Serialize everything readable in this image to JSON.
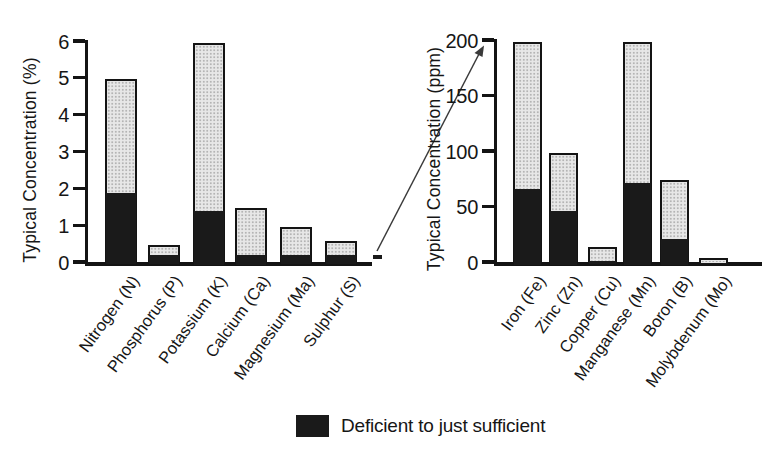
{
  "figure": {
    "legend": {
      "label": "Deficient to just sufficient"
    },
    "colors": {
      "deficient_fill": "#1a1a1a",
      "typical_fill": "#e7e7e7",
      "typical_dot": "#b4b4b4",
      "axis": "#141414",
      "background": "#ffffff",
      "arrow": "#3a3a3a"
    },
    "annotation": "magnification arrow linking the % chart baseline to the top of the ppm scale"
  },
  "chart_data": [
    {
      "type": "bar",
      "stacked": true,
      "title": "",
      "xlabel": "",
      "ylabel": "Typical Concentration (%)",
      "ylim": [
        0,
        6
      ],
      "yticks": [
        0,
        1,
        2,
        3,
        4,
        5,
        6
      ],
      "grid": false,
      "legend_position": "bottom",
      "categories": [
        "Nitrogen (N)",
        "Phosphorus (P)",
        "Potassium (K)",
        "Calcium (Ca)",
        "Magnesium (Ma)",
        "Sulphur (S)"
      ],
      "series": [
        {
          "name": "Deficient to just sufficient",
          "values": [
            2.0,
            0.3,
            1.5,
            0.3,
            0.3,
            0.3
          ]
        },
        {
          "name": "Sufficient to typical (upper stack)",
          "values": [
            3.0,
            0.2,
            4.5,
            1.2,
            0.7,
            0.3
          ]
        }
      ],
      "totals": [
        5.0,
        0.5,
        6.0,
        1.5,
        1.0,
        0.6
      ]
    },
    {
      "type": "bar",
      "stacked": true,
      "title": "",
      "xlabel": "",
      "ylabel": "Typical Concentration (ppm)",
      "ylim": [
        0,
        200
      ],
      "yticks": [
        0,
        50,
        100,
        150,
        200
      ],
      "grid": false,
      "legend_position": "bottom",
      "categories": [
        "Iron (Fe)",
        "Zinc (Zn)",
        "Copper (Cu)",
        "Manganese (Mn)",
        "Boron (B)",
        "Molybdenum (Mo)"
      ],
      "series": [
        {
          "name": "Deficient to just sufficient",
          "values": [
            70,
            50,
            5,
            75,
            25,
            2
          ]
        },
        {
          "name": "Sufficient to typical (upper stack)",
          "values": [
            130,
            50,
            10,
            125,
            50,
            3
          ]
        }
      ],
      "totals": [
        200,
        100,
        15,
        200,
        75,
        5
      ]
    }
  ]
}
